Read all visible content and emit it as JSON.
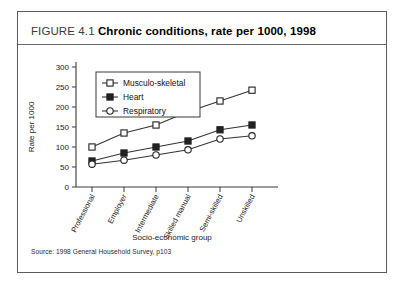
{
  "figure": {
    "label": "FIGURE 4.1",
    "name": "Chronic conditions, rate per 1000, 1998",
    "source": "Source: 1998 General Household Survey, p103"
  },
  "chart_data": {
    "type": "line",
    "title": "Chronic conditions, rate per 1000, 1998",
    "xlabel": "Socio-economic group",
    "ylabel": "Rate per 1000",
    "categories": [
      "Professional",
      "Employer",
      "Intermediate",
      "Skilled manual",
      "Semi-skilled",
      "Unskilled"
    ],
    "yticks": [
      0,
      50,
      100,
      150,
      200,
      250,
      300
    ],
    "ylim": [
      0,
      300
    ],
    "grid": false,
    "legend_position": "upper-left",
    "series": [
      {
        "name": "Musculo-skeletal",
        "marker": "open-square",
        "values": [
          100,
          135,
          155,
          188,
          215,
          242
        ]
      },
      {
        "name": "Heart",
        "marker": "filled-square",
        "values": [
          65,
          85,
          100,
          115,
          143,
          155
        ]
      },
      {
        "name": "Respiratory",
        "marker": "open-circle",
        "values": [
          57,
          67,
          80,
          93,
          120,
          128
        ]
      }
    ]
  },
  "colors": {
    "frame": "#5b5b5b",
    "axis": "#3a3a3a",
    "series": "#333333",
    "text": "#1a1a1a",
    "background": "#ffffff"
  }
}
